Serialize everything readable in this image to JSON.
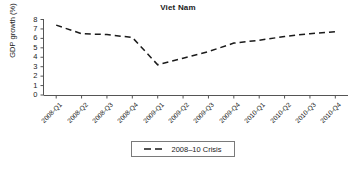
{
  "chart_data": {
    "type": "line",
    "title": "Viet Nam",
    "xlabel": "",
    "ylabel": "GDP growth (%)",
    "categories": [
      "2008-Q1",
      "2008-Q2",
      "2008-Q3",
      "2008-Q4",
      "2009-Q1",
      "2009-Q2",
      "2009-Q3",
      "2009-Q4",
      "2010-Q1",
      "2010-Q2",
      "2010-Q3",
      "2010-Q4"
    ],
    "series": [
      {
        "name": "2008–10 Crisis",
        "values": [
          7.4,
          6.5,
          6.4,
          6.1,
          3.2,
          3.9,
          4.6,
          5.5,
          5.8,
          6.2,
          6.5,
          6.7
        ],
        "style": "dashed",
        "color": "#1a1a1a"
      }
    ],
    "ylim": [
      0,
      8
    ],
    "yticks": [
      0,
      1,
      2,
      3,
      4,
      5,
      6,
      7,
      8
    ],
    "ytick_labels": [
      "0",
      "1",
      "2",
      "3",
      "4",
      "5",
      "6",
      "7",
      "8"
    ],
    "grid": false,
    "legend_position": "bottom-center",
    "legend_entries": [
      "2008–10 Crisis"
    ],
    "axis_color": "#555555"
  }
}
